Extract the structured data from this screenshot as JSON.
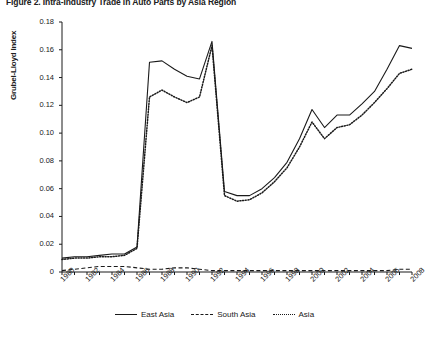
{
  "title": "Figure 2.   Intra-Industry Trade in Auto Parts by Asia Region",
  "axes": {
    "ylabel": "Grubel-Lloyd Index",
    "ytick_labels": [
      "0.18",
      "0.16",
      "0.14",
      "0.12",
      "0.10",
      "0.08",
      "0.06",
      "0.04",
      "0.02",
      "0"
    ],
    "xtick_labels": [
      "1980",
      "1982",
      "1984",
      "1986",
      "1988",
      "1990",
      "1992",
      "1994",
      "1996",
      "1998",
      "2000",
      "2002",
      "2004",
      "2006",
      "2008"
    ]
  },
  "legend": {
    "items": [
      {
        "label": "East Asia",
        "style": "solid"
      },
      {
        "label": "South Asia",
        "style": "dashed"
      },
      {
        "label": "Asia",
        "style": "dotted"
      }
    ]
  },
  "chart_data": {
    "type": "line",
    "title": "Figure 2.   Intra-Industry Trade in Auto Parts by Asia Region",
    "xlabel": "",
    "ylabel": "Grubel-Lloyd Index",
    "ylim": [
      0,
      0.18
    ],
    "xlim": [
      1980,
      2008
    ],
    "yticks": [
      0,
      0.02,
      0.04,
      0.06,
      0.08,
      0.1,
      0.12,
      0.14,
      0.16,
      0.18
    ],
    "xticks": [
      1980,
      1982,
      1984,
      1986,
      1988,
      1990,
      1992,
      1994,
      1996,
      1998,
      2000,
      2002,
      2004,
      2006,
      2008
    ],
    "grid": false,
    "legend_position": "bottom",
    "x": [
      1980,
      1981,
      1982,
      1983,
      1984,
      1985,
      1986,
      1987,
      1988,
      1989,
      1990,
      1991,
      1992,
      1993,
      1994,
      1995,
      1996,
      1997,
      1998,
      1999,
      2000,
      2001,
      2002,
      2003,
      2004,
      2005,
      2006,
      2007,
      2008
    ],
    "series": [
      {
        "name": "East Asia",
        "style": "solid",
        "color": "#1a1a1a",
        "values": [
          0.01,
          0.011,
          0.011,
          0.012,
          0.013,
          0.013,
          0.018,
          0.151,
          0.152,
          0.146,
          0.141,
          0.139,
          0.166,
          0.058,
          0.055,
          0.055,
          0.06,
          0.068,
          0.079,
          0.096,
          0.117,
          0.104,
          0.113,
          0.113,
          0.121,
          0.13,
          0.146,
          0.163,
          0.161
        ]
      },
      {
        "name": "South Asia",
        "style": "dashed",
        "color": "#1a1a1a",
        "values": [
          0.001,
          0.002,
          0.003,
          0.004,
          0.004,
          0.004,
          0.003,
          0.002,
          0.002,
          0.003,
          0.003,
          0.002,
          0.001,
          0.001,
          0.001,
          0.001,
          0.001,
          0.001,
          0.001,
          0.001,
          0.001,
          0.001,
          0.001,
          0.001,
          0.001,
          0.001,
          0.001,
          0.002,
          0.002
        ]
      },
      {
        "name": "Asia",
        "style": "dotted",
        "color": "#1a1a1a",
        "values": [
          0.009,
          0.01,
          0.01,
          0.011,
          0.011,
          0.012,
          0.017,
          0.126,
          0.131,
          0.126,
          0.122,
          0.126,
          0.163,
          0.055,
          0.051,
          0.052,
          0.057,
          0.065,
          0.075,
          0.09,
          0.108,
          0.096,
          0.104,
          0.106,
          0.113,
          0.122,
          0.132,
          0.143,
          0.146
        ]
      }
    ]
  }
}
